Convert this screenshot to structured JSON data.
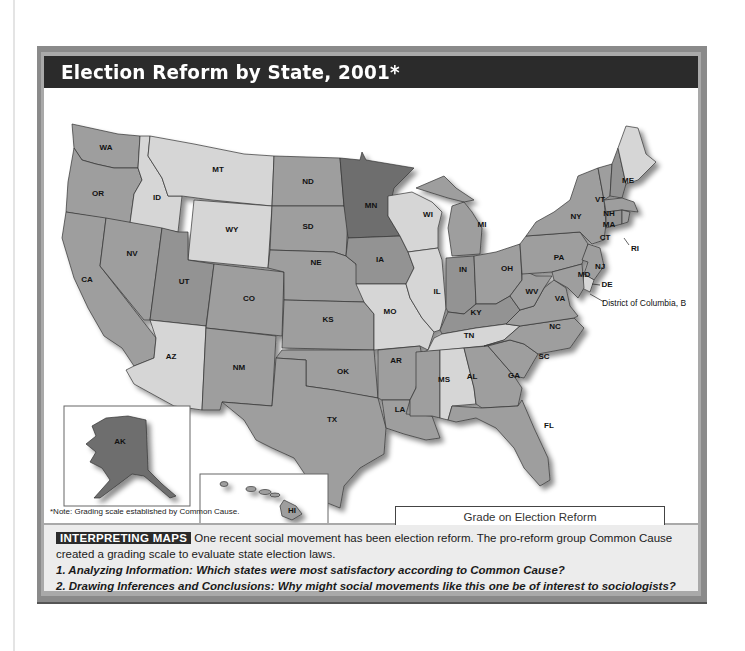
{
  "title": "Election Reform by State, 2001*",
  "colors": {
    "A": "#6e6e6e",
    "B": "#939393",
    "C": "#9e9e9e",
    "D": "#d6d6d6",
    "F": "#a3a3a3",
    "title_bar": "#2b2b2b",
    "frame": "#a9a9a9"
  },
  "legend": {
    "title": "Grade on Election Reform",
    "items": [
      {
        "grade": "A",
        "label": "A"
      },
      {
        "grade": "B",
        "label": "B"
      },
      {
        "grade": "C",
        "label": "C"
      },
      {
        "grade": "D",
        "label": "D"
      },
      {
        "grade": "F",
        "label": "F"
      }
    ]
  },
  "map": {
    "states": [
      {
        "abbr": "WA",
        "grade": "C"
      },
      {
        "abbr": "OR",
        "grade": "C"
      },
      {
        "abbr": "CA",
        "grade": "C"
      },
      {
        "abbr": "ID",
        "grade": "D"
      },
      {
        "abbr": "NV",
        "grade": "C"
      },
      {
        "abbr": "MT",
        "grade": "D"
      },
      {
        "abbr": "WY",
        "grade": "D"
      },
      {
        "abbr": "UT",
        "grade": "B"
      },
      {
        "abbr": "AZ",
        "grade": "D"
      },
      {
        "abbr": "CO",
        "grade": "C"
      },
      {
        "abbr": "NM",
        "grade": "C"
      },
      {
        "abbr": "ND",
        "grade": "C"
      },
      {
        "abbr": "SD",
        "grade": "C"
      },
      {
        "abbr": "NE",
        "grade": "C"
      },
      {
        "abbr": "KS",
        "grade": "C"
      },
      {
        "abbr": "OK",
        "grade": "C"
      },
      {
        "abbr": "TX",
        "grade": "C"
      },
      {
        "abbr": "MN",
        "grade": "A"
      },
      {
        "abbr": "IA",
        "grade": "B"
      },
      {
        "abbr": "MO",
        "grade": "D"
      },
      {
        "abbr": "AR",
        "grade": "C"
      },
      {
        "abbr": "LA",
        "grade": "C"
      },
      {
        "abbr": "WI",
        "grade": "D"
      },
      {
        "abbr": "IL",
        "grade": "D"
      },
      {
        "abbr": "MI",
        "grade": "C"
      },
      {
        "abbr": "IN",
        "grade": "B"
      },
      {
        "abbr": "OH",
        "grade": "C"
      },
      {
        "abbr": "KY",
        "grade": "B"
      },
      {
        "abbr": "TN",
        "grade": "D"
      },
      {
        "abbr": "MS",
        "grade": "C"
      },
      {
        "abbr": "AL",
        "grade": "D"
      },
      {
        "abbr": "GA",
        "grade": "C"
      },
      {
        "abbr": "FL",
        "grade": "C"
      },
      {
        "abbr": "SC",
        "grade": "C"
      },
      {
        "abbr": "NC",
        "grade": "C"
      },
      {
        "abbr": "VA",
        "grade": "C"
      },
      {
        "abbr": "WV",
        "grade": "C"
      },
      {
        "abbr": "PA",
        "grade": "C"
      },
      {
        "abbr": "NY",
        "grade": "C"
      },
      {
        "abbr": "VT",
        "grade": "C"
      },
      {
        "abbr": "NH",
        "grade": "B"
      },
      {
        "abbr": "ME",
        "grade": "D"
      },
      {
        "abbr": "MA",
        "grade": "C"
      },
      {
        "abbr": "RI",
        "grade": "C"
      },
      {
        "abbr": "CT",
        "grade": "B"
      },
      {
        "abbr": "NJ",
        "grade": "C"
      },
      {
        "abbr": "DE",
        "grade": "D"
      },
      {
        "abbr": "MD",
        "grade": "C"
      },
      {
        "abbr": "AK",
        "grade": "A"
      },
      {
        "abbr": "HI",
        "grade": "C"
      }
    ],
    "dc_label": "District of Columbia, B",
    "labels": {
      "WA": "WA",
      "OR": "OR",
      "CA": "CA",
      "ID": "ID",
      "NV": "NV",
      "MT": "MT",
      "WY": "WY",
      "UT": "UT",
      "AZ": "AZ",
      "CO": "CO",
      "NM": "NM",
      "ND": "ND",
      "SD": "SD",
      "NE": "NE",
      "KS": "KS",
      "OK": "OK",
      "TX": "TX",
      "MN": "MN",
      "IA": "IA",
      "MO": "MO",
      "AR": "AR",
      "LA": "LA",
      "WI": "WI",
      "IL": "IL",
      "MI": "MI",
      "IN": "IN",
      "OH": "OH",
      "KY": "KY",
      "TN": "TN",
      "MS": "MS",
      "AL": "AL",
      "GA": "GA",
      "FL": "FL",
      "SC": "SC",
      "NC": "NC",
      "VA": "VA",
      "WV": "WV",
      "PA": "PA",
      "NY": "NY",
      "VT": "VT",
      "NH": "NH",
      "ME": "ME",
      "MA": "MA",
      "RI": "RI",
      "CT": "CT",
      "NJ": "NJ",
      "DE": "DE",
      "MD": "MD",
      "AK": "AK",
      "HI": "HI"
    }
  },
  "note": "*Note: Grading scale established by Common Cause.",
  "caption": {
    "badge": "INTERPRETING MAPS",
    "text": " One recent social movement has been election reform. The pro-reform group Common Cause created a grading scale to evaluate state election laws.",
    "q1": "1. Analyzing Information: Which states were most satisfactory according to Common Cause?",
    "q2": "2. Drawing Inferences and Conclusions: Why might social movements like this one be of interest to sociologists?"
  }
}
